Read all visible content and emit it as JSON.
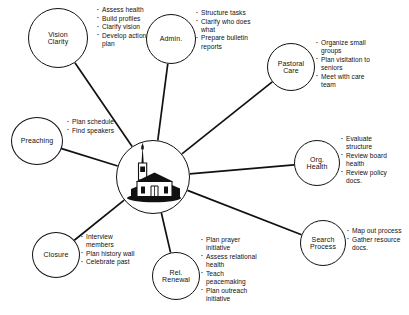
{
  "diagram": {
    "hub": {
      "icon_name": "church-building-icon",
      "label": ""
    },
    "nodes": [
      {
        "id": "vision-clarity",
        "label": "Vision\nClarity",
        "cx": 58,
        "cy": 38,
        "rx": 30,
        "ry": 30,
        "bullets": [
          "Assess health",
          "Build profiles",
          "Clarify vision",
          "Develop action\nplan"
        ],
        "bullets_x": 97,
        "bullets_y": 6
      },
      {
        "id": "admin",
        "label": "Admin.",
        "cx": 171,
        "cy": 39,
        "rx": 25,
        "ry": 25,
        "bullets": [
          "Structure tasks",
          "Clarify who does\nwhat",
          "Prepare bulletin\nreports"
        ],
        "bullets_x": 196,
        "bullets_y": 9
      },
      {
        "id": "pastoral-care",
        "label": "Pastoral\nCare",
        "cx": 291,
        "cy": 67,
        "rx": 24,
        "ry": 24,
        "bullets": [
          "Organize small\ngroups",
          "Plan visitation to\nseniors",
          "Meet with care\nteam"
        ],
        "bullets_x": 316,
        "bullets_y": 39
      },
      {
        "id": "org-health",
        "label": "Org.\nHealth",
        "cx": 317,
        "cy": 163,
        "rx": 23,
        "ry": 23,
        "bullets": [
          "Evaluate\nstructure",
          "Review board\nhealth",
          "Review policy\ndocs."
        ],
        "bullets_x": 341,
        "bullets_y": 135
      },
      {
        "id": "search-process",
        "label": "Search\nProcess",
        "cx": 323,
        "cy": 243,
        "rx": 23,
        "ry": 23,
        "bullets": [
          "Map out process",
          "Gather resource\ndocs."
        ],
        "bullets_x": 347,
        "bullets_y": 227
      },
      {
        "id": "rel-renewal",
        "label": "Rel.\nRenewal",
        "cx": 176,
        "cy": 276,
        "rx": 24,
        "ry": 24,
        "bullets": [
          "Plan prayer\ninitiative",
          "Assess relational\nhealth",
          "Teach\npeacemaking",
          "Plan outreach\ninitiative"
        ],
        "bullets_x": 201,
        "bullets_y": 236
      },
      {
        "id": "closure",
        "label": "Closure",
        "cx": 56,
        "cy": 255,
        "rx": 24,
        "ry": 23,
        "bullets": [
          "Interview\nmembers",
          "Plan history wall",
          "Celebrate past"
        ],
        "bullets_x": 81,
        "bullets_y": 233
      },
      {
        "id": "preaching",
        "label": "Preaching",
        "cx": 37,
        "cy": 141,
        "rx": 26,
        "ry": 24,
        "bullets": [
          "Plan schedule",
          "Find speakers"
        ],
        "bullets_x": 67,
        "bullets_y": 118
      }
    ],
    "colors": {
      "stroke": "#111111",
      "background": "#ffffff",
      "text": "#111111"
    }
  }
}
